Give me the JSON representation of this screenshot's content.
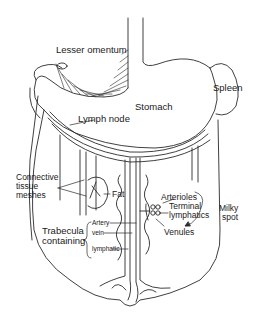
{
  "diagram": {
    "labels": {
      "lesser_omentum": "Lesser omentum",
      "stomach": "Stomach",
      "spleen": "Spleen",
      "lymph_node": "Lymph node",
      "connective_tissue_1": "Connective",
      "connective_tissue_2": "tissue",
      "connective_tissue_3": "meshes",
      "fat": "Fat",
      "arterioles": "Arterioles",
      "terminal_1": "Terminal",
      "terminal_2": "lymphatics",
      "milky_1": "Milky",
      "milky_2": "spot",
      "venules": "Venules",
      "trabecula_1": "Trabecula",
      "trabecula_2": "containing",
      "artery": "Artery",
      "vein": "vein",
      "lymphatic": "lymphatic"
    },
    "colors": {
      "line": "#2a2a2a",
      "background": "#ffffff"
    }
  }
}
